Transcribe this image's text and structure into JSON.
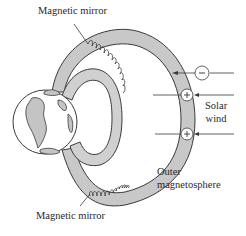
{
  "labels": {
    "top_mirror": "Magnetic mirror",
    "bottom_mirror": "Magnetic mirror",
    "solar_wind_line1": "Solar",
    "solar_wind_line2": "wind",
    "outer_line1": "Outer",
    "outer_line2": "magnetosphere"
  },
  "particles": [
    {
      "charge": "−",
      "y": 73,
      "name": "electron"
    },
    {
      "charge": "+",
      "y": 95,
      "name": "proton"
    },
    {
      "charge": "+",
      "y": 134,
      "name": "proton"
    }
  ],
  "colors": {
    "belt_fill": "#c8c8c8",
    "outline": "#3a3a3a",
    "land": "#c4c4c4",
    "background": "#ffffff"
  }
}
